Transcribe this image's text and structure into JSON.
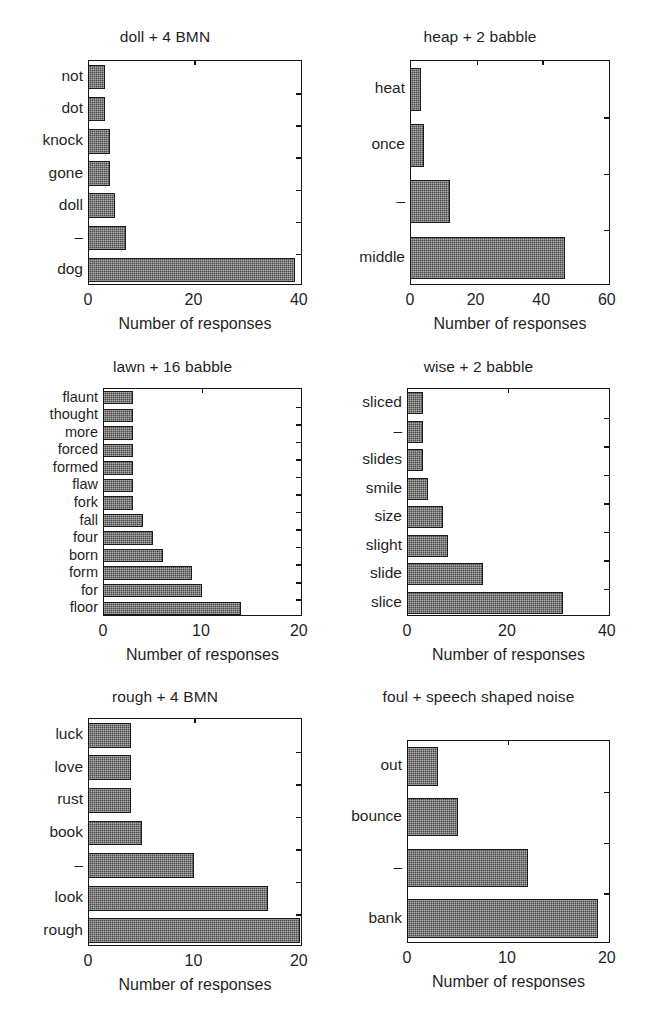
{
  "figure": {
    "background": "#ffffff",
    "bar_color": "#4a4a4a",
    "axis_color": "#151515",
    "panel_count": 6
  },
  "chart_data": [
    {
      "id": "doll-4-bmn",
      "type": "bar",
      "orientation": "horizontal",
      "title": "doll + 4 BMN",
      "xlabel": "Number of responses",
      "ylabel": "",
      "xlim": [
        0,
        40
      ],
      "xticks": [
        0,
        20,
        40
      ],
      "xtick_labels": [
        "0",
        "20",
        "40"
      ],
      "grid": false,
      "legend": "none",
      "categories": [
        "not",
        "dot",
        "knock",
        "gone",
        "doll",
        "–",
        "dog"
      ],
      "values": [
        3,
        3,
        4,
        4,
        5,
        7,
        39
      ]
    },
    {
      "id": "heap-2-babble",
      "type": "bar",
      "orientation": "horizontal",
      "title": "heap + 2 babble",
      "xlabel": "Number of responses",
      "ylabel": "",
      "xlim": [
        0,
        60
      ],
      "xticks": [
        0,
        20,
        40,
        60
      ],
      "xtick_labels": [
        "0",
        "20",
        "40",
        "60"
      ],
      "grid": false,
      "legend": "none",
      "categories": [
        "heat",
        "once",
        "–",
        "middle"
      ],
      "values": [
        3,
        4,
        12,
        47
      ]
    },
    {
      "id": "lawn-16-babble",
      "type": "bar",
      "orientation": "horizontal",
      "title": "lawn + 16 babble",
      "xlabel": "Number of responses",
      "ylabel": "",
      "xlim": [
        0,
        20
      ],
      "xticks": [
        0,
        10,
        20
      ],
      "xtick_labels": [
        "0",
        "10",
        "20"
      ],
      "grid": false,
      "legend": "none",
      "categories": [
        "flaunt",
        "thought",
        "more",
        "forced",
        "formed",
        "flaw",
        "fork",
        "fall",
        "four",
        "born",
        "form",
        "for",
        "floor"
      ],
      "values": [
        3,
        3,
        3,
        3,
        3,
        3,
        3,
        4,
        5,
        6,
        9,
        10,
        14
      ]
    },
    {
      "id": "wise-2-babble",
      "type": "bar",
      "orientation": "horizontal",
      "title": "wise + 2 babble",
      "xlabel": "Number of responses",
      "ylabel": "",
      "xlim": [
        0,
        40
      ],
      "xticks": [
        0,
        20,
        40
      ],
      "xtick_labels": [
        "0",
        "20",
        "40"
      ],
      "grid": false,
      "legend": "none",
      "categories": [
        "sliced",
        "–",
        "slides",
        "smile",
        "size",
        "slight",
        "slide",
        "slice"
      ],
      "values": [
        3,
        3,
        3,
        4,
        7,
        8,
        15,
        31
      ]
    },
    {
      "id": "rough-4-bmn",
      "type": "bar",
      "orientation": "horizontal",
      "title": "rough + 4 BMN",
      "xlabel": "Number of responses",
      "ylabel": "",
      "xlim": [
        0,
        20
      ],
      "xticks": [
        0,
        10,
        20
      ],
      "xtick_labels": [
        "0",
        "10",
        "20"
      ],
      "grid": false,
      "legend": "none",
      "categories": [
        "luck",
        "love",
        "rust",
        "book",
        "–",
        "look",
        "rough"
      ],
      "values": [
        4,
        4,
        4,
        5,
        10,
        17,
        20
      ]
    },
    {
      "id": "foul-ssn",
      "type": "bar",
      "orientation": "horizontal",
      "title": "foul + speech shaped noise",
      "xlabel": "Number of responses",
      "ylabel": "",
      "xlim": [
        0,
        20
      ],
      "xticks": [
        0,
        10,
        20
      ],
      "xtick_labels": [
        "0",
        "10",
        "20"
      ],
      "grid": false,
      "legend": "none",
      "categories": [
        "out",
        "bounce",
        "–",
        "bank"
      ],
      "values": [
        3,
        5,
        12,
        19
      ]
    }
  ]
}
